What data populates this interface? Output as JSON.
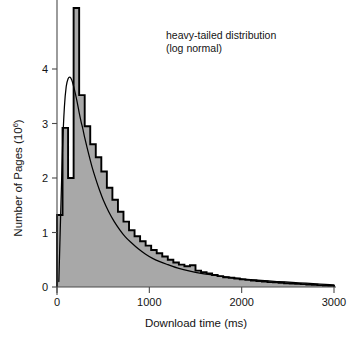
{
  "chart_data": {
    "type": "area",
    "title": "",
    "subtitle": "",
    "xlabel": "Download time (ms)",
    "ylabel_main": "Number of Pages (10",
    "ylabel_exp": "6",
    "ylabel_tail": ")",
    "ylabel_full": "Number of Pages (10⁶)",
    "xlim": [
      0,
      3000
    ],
    "ylim": [
      0,
      5.3
    ],
    "xticks": [
      0,
      1000,
      2000,
      3000
    ],
    "xticklabels": [
      "0",
      "1000",
      "2000",
      "3000"
    ],
    "yticks": [
      0,
      1,
      2,
      3,
      4
    ],
    "yticklabels": [
      "0",
      "1",
      "2",
      "3",
      "4"
    ],
    "grid": false,
    "legend": null,
    "annotations": [
      {
        "name": "distribution-label",
        "line1": "heavy-tailed distribution",
        "line2": "(log normal)",
        "x": 1180,
        "y": 4.55
      }
    ],
    "series": [
      {
        "name": "histogram",
        "type": "step-histogram",
        "fill_color": "#a8a8a8",
        "line_color": "#000000",
        "bin_width": 60,
        "bin_starts": [
          0,
          60,
          120,
          180,
          240,
          300,
          360,
          420,
          480,
          540,
          600,
          660,
          720,
          780,
          840,
          900,
          960,
          1020,
          1080,
          1140,
          1200,
          1260,
          1320,
          1380,
          1440,
          1500,
          1560,
          1620,
          1680,
          1740,
          1800,
          1860,
          1920,
          1980,
          2040,
          2100,
          2160,
          2220,
          2280,
          2340,
          2400,
          2460,
          2520,
          2580,
          2640,
          2700,
          2760,
          2820,
          2880,
          2940
        ],
        "values": [
          1.32,
          2.92,
          2.0,
          5.12,
          3.52,
          2.95,
          2.62,
          2.38,
          2.12,
          1.82,
          1.6,
          1.38,
          1.2,
          1.04,
          0.93,
          0.84,
          0.76,
          0.68,
          0.62,
          0.56,
          0.5,
          0.45,
          0.41,
          0.38,
          0.4,
          0.3,
          0.27,
          0.25,
          0.22,
          0.2,
          0.18,
          0.17,
          0.155,
          0.14,
          0.13,
          0.12,
          0.11,
          0.1,
          0.09,
          0.085,
          0.078,
          0.07,
          0.065,
          0.058,
          0.052,
          0.046,
          0.04,
          0.034,
          0.028,
          0.02
        ]
      },
      {
        "name": "lognormal-fit",
        "type": "line",
        "line_color": "#000000",
        "x": [
          20,
          40,
          60,
          80,
          100,
          120,
          140,
          160,
          180,
          200,
          220,
          240,
          260,
          280,
          300,
          340,
          380,
          420,
          460,
          500,
          560,
          620,
          680,
          740,
          800,
          880,
          960,
          1040,
          1120,
          1200,
          1320,
          1440,
          1560,
          1680,
          1800,
          1950,
          2100,
          2250,
          2400,
          2550,
          2700,
          2850,
          3000
        ],
        "y": [
          0.1,
          1.35,
          2.55,
          3.3,
          3.68,
          3.82,
          3.85,
          3.8,
          3.68,
          3.54,
          3.38,
          3.2,
          3.04,
          2.9,
          2.74,
          2.46,
          2.2,
          1.98,
          1.78,
          1.6,
          1.38,
          1.2,
          1.05,
          0.92,
          0.82,
          0.7,
          0.6,
          0.52,
          0.46,
          0.41,
          0.34,
          0.29,
          0.25,
          0.22,
          0.19,
          0.16,
          0.135,
          0.115,
          0.1,
          0.085,
          0.07,
          0.055,
          0.04
        ]
      }
    ]
  },
  "figure": {
    "background": "#ffffff",
    "axis_color": "#4a4a4a",
    "fill_color": "#a8a8a8",
    "line_color": "#000000"
  }
}
